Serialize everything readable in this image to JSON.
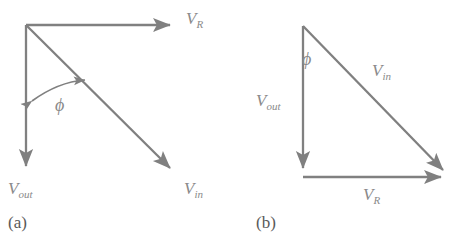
{
  "figure": {
    "type": "vector-phasor-diagram",
    "background_color": "#ffffff",
    "stroke_color": "#808080",
    "label_color": "#8a8a8a",
    "caption_color": "#5a5a5a",
    "panels": [
      {
        "id": "a",
        "caption": "(a)",
        "description": "Three vectors from a common origin at top-left",
        "angle_symbol": "ϕ",
        "vectors": [
          {
            "name": "V_R",
            "label_main": "V",
            "label_sub": "R",
            "from": [
              26,
              25
            ],
            "to": [
              177,
              25
            ],
            "direction": "right",
            "arrowhead": true
          },
          {
            "name": "V_out",
            "label_main": "V",
            "label_sub": "out",
            "from": [
              26,
              25
            ],
            "to": [
              26,
              173
            ],
            "direction": "down",
            "arrowhead": true
          },
          {
            "name": "V_in",
            "label_main": "V",
            "label_sub": "in",
            "from": [
              26,
              25
            ],
            "to": [
              176,
              174
            ],
            "direction": "down-right",
            "arrowhead": true
          }
        ],
        "angle_arc": {
          "symbol": "ϕ",
          "between": [
            "V_out",
            "V_in"
          ],
          "double_headed": true
        }
      },
      {
        "id": "b",
        "caption": "(b)",
        "description": "Right triangle of the same three vectors placed head to tail",
        "angle_symbol": "ϕ",
        "vectors": [
          {
            "name": "V_out",
            "label_main": "V",
            "label_sub": "out",
            "from": [
              65,
              26
            ],
            "to": [
              65,
              175
            ],
            "direction": "down",
            "arrowhead": true
          },
          {
            "name": "V_R",
            "label_main": "V",
            "label_sub": "R",
            "from": [
              65,
              177
            ],
            "to": [
              210,
              177
            ],
            "direction": "right",
            "arrowhead": true
          },
          {
            "name": "V_in",
            "label_main": "V",
            "label_sub": "in",
            "from": [
              65,
              26
            ],
            "to": [
              211,
              176
            ],
            "direction": "down-right",
            "arrowhead": true
          }
        ],
        "angle_arc": {
          "symbol": "ϕ",
          "between": [
            "V_out",
            "V_in"
          ],
          "double_headed": false
        }
      }
    ]
  },
  "labels": {
    "a": {
      "vr_main": "V",
      "vr_sub": "R",
      "vout_main": "V",
      "vout_sub": "out",
      "vin_main": "V",
      "vin_sub": "in",
      "phi": "ϕ",
      "caption": "(a)"
    },
    "b": {
      "vr_main": "V",
      "vr_sub": "R",
      "vout_main": "V",
      "vout_sub": "out",
      "vin_main": "V",
      "vin_sub": "in",
      "phi": "ϕ",
      "caption": "(b)"
    }
  }
}
